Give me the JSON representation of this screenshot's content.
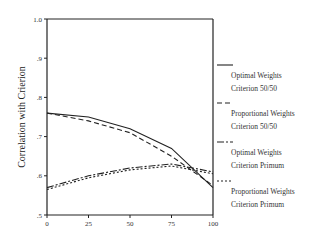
{
  "chart_data": {
    "type": "line",
    "title": "",
    "xlabel": "",
    "ylabel": "Correlation with Crierion",
    "x": [
      0,
      25,
      50,
      75,
      100
    ],
    "xticks": [
      "0",
      "25",
      "50",
      "75",
      "100"
    ],
    "yticks": [
      "1.0",
      ".9",
      ".8",
      ".7",
      ".6",
      ".5"
    ],
    "ylim": [
      0.5,
      1.0
    ],
    "xlim": [
      0,
      100
    ],
    "grid": false,
    "legend_position": "right",
    "series": [
      {
        "name": "Optimal Weights Criterion 50/50",
        "label_lines": [
          "Optimal Weights",
          "Criterion 50/50"
        ],
        "style": "solid",
        "values": [
          0.76,
          0.75,
          0.72,
          0.67,
          0.57
        ]
      },
      {
        "name": "Proportional Weights Criterion 50/50",
        "label_lines": [
          "Proportional Weights",
          "Criterion 50/50"
        ],
        "style": "dashed",
        "values": [
          0.76,
          0.74,
          0.71,
          0.65,
          0.575
        ]
      },
      {
        "name": "Optimal Weights Criterion Primum",
        "label_lines": [
          "Optimal Weights",
          "Criterion Primum"
        ],
        "style": "dashdot",
        "values": [
          0.57,
          0.6,
          0.62,
          0.63,
          0.61
        ]
      },
      {
        "name": "Proportional Weights Criterion Primum",
        "label_lines": [
          "Proportional Weights",
          "Criterion Primum"
        ],
        "style": "dotted",
        "values": [
          0.565,
          0.595,
          0.615,
          0.625,
          0.605
        ]
      }
    ]
  }
}
